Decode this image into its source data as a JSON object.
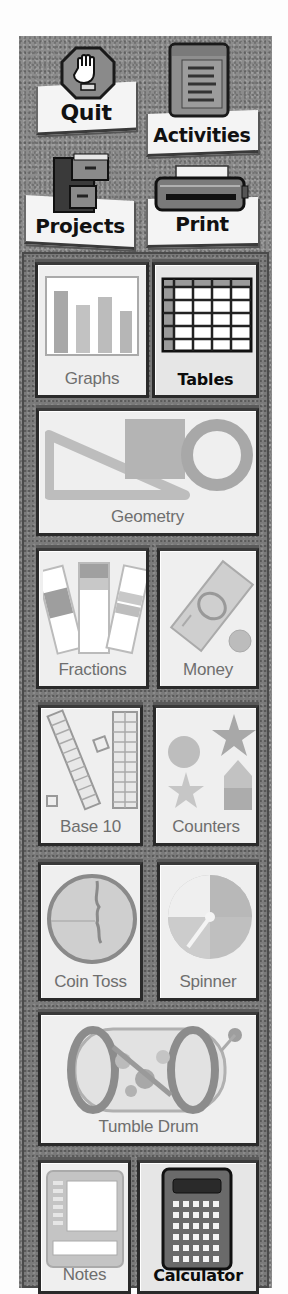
{
  "toolbar": {
    "quit": {
      "label": "Quit",
      "icon": "stop-hand-icon"
    },
    "activities": {
      "label": "Activities",
      "icon": "clipboard-list-icon"
    },
    "projects": {
      "label": "Projects",
      "icon": "file-cabinet-icon"
    },
    "print": {
      "label": "Print",
      "icon": "printer-icon"
    }
  },
  "tools": [
    {
      "id": "graphs",
      "label": "Graphs",
      "icon": "bar-graph-icon",
      "active": false
    },
    {
      "id": "tables",
      "label": "Tables",
      "icon": "table-grid-icon",
      "active": true
    },
    {
      "id": "geometry",
      "label": "Geometry",
      "icon": "geometry-shapes-icon",
      "active": false
    },
    {
      "id": "fractions",
      "label": "Fractions",
      "icon": "fraction-bars-icon",
      "active": false
    },
    {
      "id": "money",
      "label": "Money",
      "icon": "money-bill-coin-icon",
      "active": false
    },
    {
      "id": "base10",
      "label": "Base 10",
      "icon": "base-ten-blocks-icon",
      "active": false
    },
    {
      "id": "counters",
      "label": "Counters",
      "icon": "counter-shapes-icon",
      "active": false
    },
    {
      "id": "cointoss",
      "label": "Coin Toss",
      "icon": "coin-icon",
      "active": false
    },
    {
      "id": "spinner",
      "label": "Spinner",
      "icon": "spinner-wheel-icon",
      "active": false
    },
    {
      "id": "tumbledrum",
      "label": "Tumble Drum",
      "icon": "tumble-drum-icon",
      "active": false
    },
    {
      "id": "notes",
      "label": "Notes",
      "icon": "notepad-icon",
      "active": false
    },
    {
      "id": "calculator",
      "label": "Calculator",
      "icon": "calculator-icon",
      "active": true
    }
  ],
  "colors": {
    "panel": "#8c8c8c",
    "tile": "#efefef",
    "tile_label": "#6e6e6e",
    "active_label": "#0c0c0c"
  }
}
